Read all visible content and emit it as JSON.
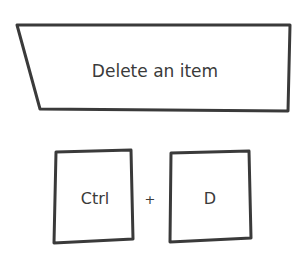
{
  "banner": {
    "label": "Delete an item"
  },
  "shortcut": {
    "keys": [
      {
        "label": "Ctrl"
      },
      {
        "label": "D"
      }
    ],
    "separator": "+"
  },
  "colors": {
    "stroke": "#3a3a3a",
    "background": "#ffffff"
  }
}
